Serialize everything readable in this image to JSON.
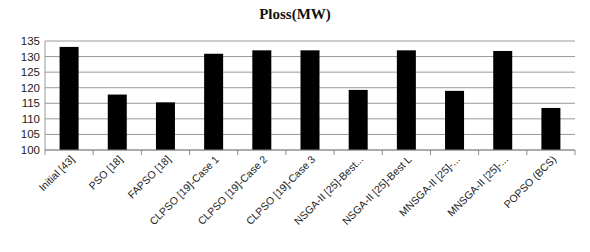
{
  "chart_data": {
    "type": "bar",
    "title": "Ploss(MW)",
    "xlabel": "",
    "ylabel": "",
    "ylim": [
      100,
      135
    ],
    "yticks": [
      100,
      105,
      110,
      115,
      120,
      125,
      130,
      135
    ],
    "grid": true,
    "legend": null,
    "bar_color": "#000000",
    "categories": [
      "Initial [43]",
      "PSO [18]",
      "FAPSO [18]",
      "CLPSO [19]-Case 1",
      "CLPSO [19]-Case 2",
      "CLPSO [19]-Case 3",
      "NSGA-II [25]-Best...",
      "NSGA-II [25]-Best L",
      "MNSGA-II [25]-...",
      "MNSGA-II [25]-...",
      "POPSO (BCS)"
    ],
    "values": [
      133.1,
      117.8,
      115.3,
      130.9,
      132.0,
      132.0,
      119.3,
      132.0,
      119.0,
      131.8,
      113.5
    ]
  }
}
